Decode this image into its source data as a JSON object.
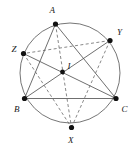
{
  "figure": {
    "background_color": "#ffffff",
    "stroke_color": "#555555",
    "vertex_color": "#111111",
    "label_color": "#1a1a1a",
    "dashed_pattern": "3,2.4",
    "circle": {
      "name": "circumcircle",
      "cx": 70,
      "cy": 73,
      "r": 50,
      "stroke": "#666666",
      "stroke_width": 0.9,
      "fill": "none"
    },
    "points": [
      {
        "id": "A",
        "label": "A",
        "x": 55.5,
        "y": 24.0,
        "r": 2.6,
        "label_x": 49.5,
        "label_y": 12.5
      },
      {
        "id": "Y",
        "label": "Y",
        "x": 110.0,
        "y": 40.5,
        "r": 2.6,
        "label_x": 117.0,
        "label_y": 35.0
      },
      {
        "id": "Z",
        "label": "Z",
        "x": 23.5,
        "y": 53.5,
        "r": 2.6,
        "label_x": 11.5,
        "label_y": 51.5
      },
      {
        "id": "B",
        "label": "B",
        "x": 24.5,
        "y": 98.5,
        "r": 2.6,
        "label_x": 14.0,
        "label_y": 112.0
      },
      {
        "id": "C",
        "label": "C",
        "x": 116.0,
        "y": 98.5,
        "r": 2.6,
        "label_x": 121.5,
        "label_y": 112.0
      },
      {
        "id": "X",
        "label": "X",
        "x": 71.5,
        "y": 127.5,
        "r": 2.6,
        "label_x": 68.0,
        "label_y": 143.0
      },
      {
        "id": "I",
        "label": "I",
        "x": 62.5,
        "y": 72.0,
        "r": 2.4,
        "label_x": 67.5,
        "label_y": 69.0
      }
    ],
    "solid_segments": [
      {
        "name": "segment-AB",
        "from": "A",
        "to": "B"
      },
      {
        "name": "segment-AC",
        "from": "A",
        "to": "C"
      },
      {
        "name": "segment-BC",
        "from": "B",
        "to": "C"
      },
      {
        "name": "cevian-BY",
        "from": "B",
        "to": "Y"
      },
      {
        "name": "cevian-CZ",
        "from": "C",
        "to": "Z"
      }
    ],
    "dashed_segments": [
      {
        "name": "segment-XY",
        "from": "X",
        "to": "Y"
      },
      {
        "name": "segment-YZ",
        "from": "Y",
        "to": "Z"
      },
      {
        "name": "segment-ZX",
        "from": "Z",
        "to": "X"
      },
      {
        "name": "cevian-AX",
        "from": "A",
        "to": "X"
      }
    ]
  }
}
